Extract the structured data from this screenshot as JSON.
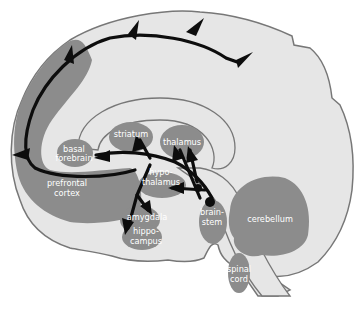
{
  "diagram": {
    "type": "sagittal brain section with neural projection pathways",
    "colors": {
      "background": "#ffffff",
      "brain_fill": "#e6e6e6",
      "outline": "#777777",
      "region_fill": "#8c8c8c",
      "pathway": "#0d0d0d",
      "label": "#ffffff"
    },
    "labels": {
      "basal_forebrain": [
        "basal",
        "forebrain"
      ],
      "prefrontal_cortex": [
        "prefrontal",
        "cortex"
      ],
      "striatum": "striatum",
      "thalamus": "thalamus",
      "hypothalamus": [
        "hypo-",
        "thalamus"
      ],
      "amygdala": "amygdala",
      "hippocampus": [
        "hippo-",
        "campus"
      ],
      "brainstem": [
        "brain-",
        "stem"
      ],
      "cerebellum": "cerebellum",
      "spinal_cord": [
        "spinal",
        "cord"
      ]
    }
  }
}
